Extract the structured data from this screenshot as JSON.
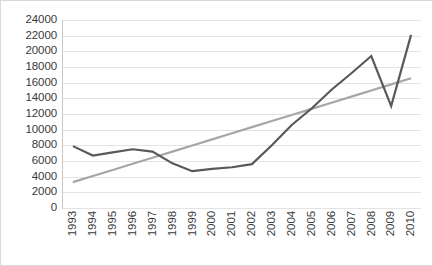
{
  "chart_data": {
    "type": "line",
    "title": "",
    "xlabel": "",
    "ylabel": "",
    "categories": [
      "1993",
      "1994",
      "1995",
      "1996",
      "1997",
      "1998",
      "1999",
      "2000",
      "2001",
      "2002",
      "2003",
      "2004",
      "2005",
      "2006",
      "2007",
      "2008",
      "2009",
      "2010"
    ],
    "ylim": [
      0,
      24000
    ],
    "ytick_step": 2000,
    "ytick_labels": [
      "24000",
      "22000",
      "20000",
      "18000",
      "16000",
      "14000",
      "12000",
      "10000",
      "8000",
      "6000",
      "4000",
      "2000",
      "0"
    ],
    "ytick_values": [
      24000,
      22000,
      20000,
      18000,
      16000,
      14000,
      12000,
      10000,
      8000,
      6000,
      4000,
      2000,
      0
    ],
    "grid": true,
    "grid_orientation": "horizontal",
    "legend": false,
    "legend_position": "none",
    "series": [
      {
        "name": "data",
        "type": "line",
        "color": "#595959",
        "width": 2.2,
        "values": [
          7900,
          6700,
          7100,
          7500,
          7200,
          5700,
          4700,
          5000,
          5200,
          5600,
          8000,
          10600,
          12700,
          15100,
          17200,
          19400,
          13000,
          22100
        ]
      },
      {
        "name": "linear-trendline",
        "type": "line",
        "color": "#a6a6a6",
        "width": 2.2,
        "values": [
          3300,
          4080,
          4860,
          5640,
          6420,
          7200,
          7980,
          8760,
          9540,
          10320,
          11100,
          11880,
          12660,
          13440,
          14220,
          15000,
          15780,
          16560
        ]
      }
    ],
    "colors": {
      "series_line": "#595959",
      "trendline": "#a6a6a6",
      "gridline": "#e3e3e3",
      "axis": "#c8c8c8",
      "tick_label": "#3a3a3a",
      "border": "#d9d9d9",
      "background": "#ffffff"
    }
  }
}
